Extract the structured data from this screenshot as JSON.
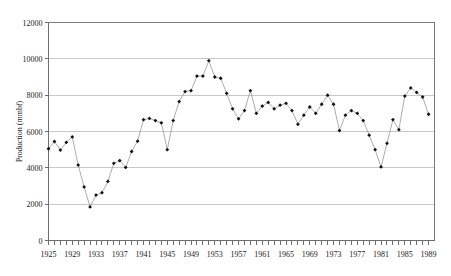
{
  "chart_data": {
    "type": "line",
    "title": "",
    "xlabel": "",
    "ylabel": "Production (mmbf)",
    "ylim": [
      0,
      12000
    ],
    "xlim": [
      1925,
      1990
    ],
    "grid": true,
    "legend": false,
    "marker": "filled-diamond",
    "ytick_labels": [
      "12000",
      "10000",
      "8000",
      "6000",
      "4000",
      "2000",
      "0"
    ],
    "ytick_values": [
      12000,
      10000,
      8000,
      6000,
      4000,
      2000,
      0
    ],
    "xtick_labels": [
      "1925",
      "1929",
      "1933",
      "1937",
      "1941",
      "1945",
      "1949",
      "1953",
      "1957",
      "1961",
      "1965",
      "1969",
      "1973",
      "1977",
      "1981",
      "1985",
      "1989"
    ],
    "xtick_values": [
      1925,
      1929,
      1933,
      1937,
      1941,
      1945,
      1949,
      1953,
      1957,
      1961,
      1965,
      1969,
      1973,
      1977,
      1981,
      1985,
      1989
    ],
    "x": [
      1925,
      1926,
      1927,
      1928,
      1929,
      1930,
      1931,
      1932,
      1933,
      1934,
      1935,
      1936,
      1937,
      1938,
      1939,
      1940,
      1941,
      1942,
      1943,
      1944,
      1945,
      1946,
      1947,
      1948,
      1949,
      1950,
      1951,
      1952,
      1953,
      1954,
      1955,
      1956,
      1957,
      1958,
      1959,
      1960,
      1961,
      1962,
      1963,
      1964,
      1965,
      1966,
      1967,
      1968,
      1969,
      1970,
      1971,
      1972,
      1973,
      1974,
      1975,
      1976,
      1977,
      1978,
      1979,
      1980,
      1981,
      1982,
      1983,
      1984,
      1985,
      1986,
      1987,
      1988,
      1989
    ],
    "values": [
      5050,
      5450,
      4980,
      5400,
      5700,
      4150,
      2950,
      1850,
      2500,
      2630,
      3250,
      4250,
      4400,
      4020,
      4900,
      5470,
      6650,
      6720,
      6600,
      6480,
      5000,
      6600,
      7650,
      8200,
      8250,
      9050,
      9050,
      9900,
      9000,
      8930,
      8100,
      7250,
      6700,
      7150,
      8250,
      7000,
      7400,
      7600,
      7250,
      7450,
      7550,
      7150,
      6400,
      6900,
      7350,
      7000,
      7500,
      8000,
      7500,
      6050,
      6900,
      7150,
      7000,
      6600,
      5800,
      5000,
      4050,
      5350,
      6650,
      6100,
      7950,
      8400,
      8150,
      7900,
      6950
    ],
    "series": [
      {
        "name": "Production",
        "values": [
          5050,
          5450,
          4980,
          5400,
          5700,
          4150,
          2950,
          1850,
          2500,
          2630,
          3250,
          4250,
          4400,
          4020,
          4900,
          5470,
          6650,
          6720,
          6600,
          6480,
          5000,
          6600,
          7650,
          8200,
          8250,
          9050,
          9050,
          9900,
          9000,
          8930,
          8100,
          7250,
          6700,
          7150,
          8250,
          7000,
          7400,
          7600,
          7250,
          7450,
          7550,
          7150,
          6400,
          6900,
          7350,
          7000,
          7500,
          8000,
          7500,
          6050,
          6900,
          7150,
          7000,
          6600,
          5800,
          5000,
          4050,
          5350,
          6650,
          6100,
          7950,
          8400,
          8150,
          7900,
          6950
        ]
      }
    ]
  }
}
